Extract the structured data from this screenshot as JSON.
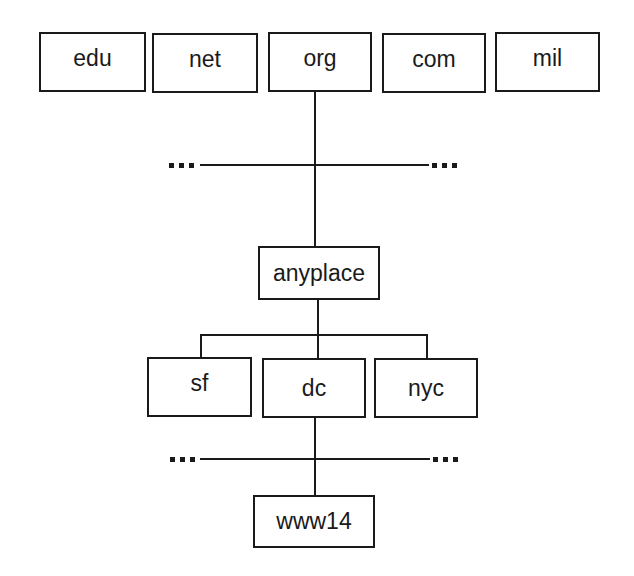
{
  "diagram": {
    "type": "dns-hierarchy-tree",
    "top_level_domains": [
      {
        "id": "edu",
        "label": "edu"
      },
      {
        "id": "net",
        "label": "net"
      },
      {
        "id": "org",
        "label": "org"
      },
      {
        "id": "com",
        "label": "com"
      },
      {
        "id": "mil",
        "label": "mil"
      }
    ],
    "second_level": [
      {
        "id": "anyplace",
        "label": "anyplace",
        "parent": "org"
      }
    ],
    "third_level": [
      {
        "id": "sf",
        "label": "sf",
        "parent": "anyplace"
      },
      {
        "id": "dc",
        "label": "dc",
        "parent": "anyplace"
      },
      {
        "id": "nyc",
        "label": "nyc",
        "parent": "anyplace"
      }
    ],
    "hosts": [
      {
        "id": "www14",
        "label": "www14",
        "parent": "dc"
      }
    ],
    "ellipsis_markers": {
      "level1_left": "...",
      "level1_right": "...",
      "level3_left": "...",
      "level3_right": "..."
    },
    "colors": {
      "line": "#1a1a1a",
      "box_border": "#1a1a1a",
      "background": "#ffffff"
    }
  }
}
